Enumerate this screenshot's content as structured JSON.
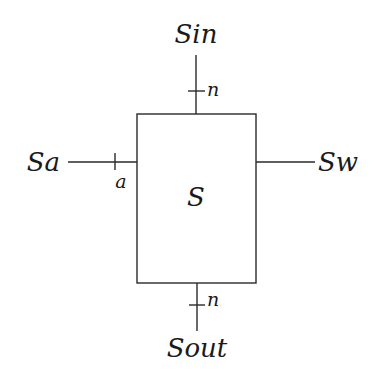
{
  "diagram": {
    "block": {
      "label": "S",
      "x": 137,
      "y": 114,
      "width": 119,
      "height": 169
    },
    "ports": {
      "top": {
        "label": "Sin",
        "width_label": "n"
      },
      "left": {
        "label": "Sa",
        "width_label": "a"
      },
      "right": {
        "label": "Sw",
        "width_label": ""
      },
      "bottom": {
        "label": "Sout",
        "width_label": "n"
      }
    },
    "colors": {
      "stroke": "#2a2a2a",
      "text": "#1a1a1a",
      "background": "#ffffff"
    }
  }
}
